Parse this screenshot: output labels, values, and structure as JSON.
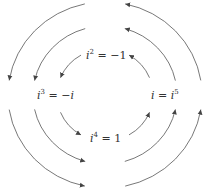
{
  "diagram": {
    "center": [
      105,
      95
    ],
    "ring_radii": [
      48,
      72,
      97
    ],
    "direction": "counter-clockwise",
    "stroke_color": "#555555",
    "labels": [
      {
        "id": "top",
        "base": "i",
        "exp": "2",
        "rest": " = −1",
        "x": 86,
        "y": 50
      },
      {
        "id": "left",
        "base": "i",
        "exp": "3",
        "rest": " = −i",
        "x": 37,
        "y": 90
      },
      {
        "id": "right",
        "base": "i",
        "exp": "",
        "rest": " = ",
        "base2": "i",
        "exp2": "5",
        "x": 151,
        "y": 90
      },
      {
        "id": "bottom",
        "base": "i",
        "exp": "4",
        "rest": " = 1",
        "x": 90,
        "y": 133
      }
    ]
  }
}
